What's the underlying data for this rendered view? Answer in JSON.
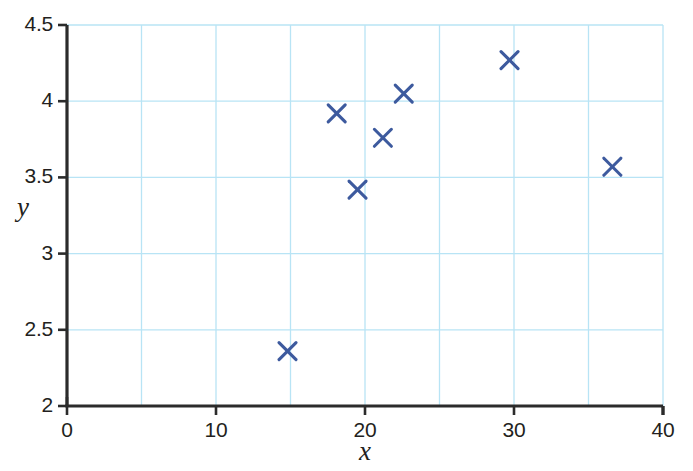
{
  "chart_data": {
    "type": "scatter",
    "title": "",
    "xlabel": "x",
    "ylabel": "y",
    "xlim": [
      0,
      40
    ],
    "ylim": [
      2,
      4.5
    ],
    "xticks": [
      0,
      10,
      20,
      30,
      40
    ],
    "xtick_labels": [
      "0",
      "10",
      "20",
      "30",
      "40"
    ],
    "yticks": [
      2,
      2.5,
      3,
      3.5,
      4,
      4.5
    ],
    "ytick_labels": [
      "2",
      "2.5",
      "3",
      "3.5",
      "4",
      "4.5"
    ],
    "grid": true,
    "grid_x_step": 5,
    "grid_y_step": 0.5,
    "grid_color": "#b8e4f5",
    "axis_color": "#2b2b2b",
    "marker": "x",
    "marker_color": "#3d5a9e",
    "legend": null,
    "points": [
      {
        "x": 14.8,
        "y": 2.36
      },
      {
        "x": 18.1,
        "y": 3.92
      },
      {
        "x": 19.5,
        "y": 3.42
      },
      {
        "x": 21.2,
        "y": 3.76
      },
      {
        "x": 22.6,
        "y": 4.05
      },
      {
        "x": 29.7,
        "y": 4.27
      },
      {
        "x": 36.6,
        "y": 3.57
      }
    ]
  }
}
